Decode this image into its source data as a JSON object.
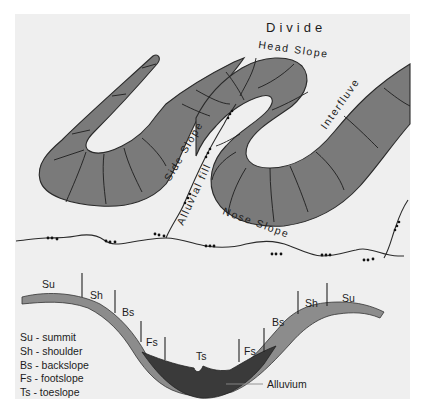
{
  "figure": {
    "type": "hillslope-geomorphology-diagram",
    "plan_view": {
      "labels": {
        "divide": "Divide",
        "head_slope": "Head Slope",
        "interfluve": "Interfluve",
        "side_slope": "Side Slope",
        "alluvial_fill": "Alluvial fill",
        "nose_slope": "Nose Slope"
      }
    },
    "profile_view": {
      "positions_left": [
        "Su",
        "Sh",
        "Bs",
        "Fs"
      ],
      "position_center": "Ts",
      "positions_right": [
        "Fs",
        "Bs",
        "Sh",
        "Su"
      ],
      "alluvium_label": "Alluvium"
    },
    "legend": [
      {
        "abbr": "Su",
        "text": "Su - summit"
      },
      {
        "abbr": "Sh",
        "text": "Sh -  shoulder"
      },
      {
        "abbr": "Bs",
        "text": "Bs - backslope"
      },
      {
        "abbr": "Fs",
        "text": "Fs - footslope"
      },
      {
        "abbr": "Ts",
        "text": "Ts - toeslope"
      }
    ],
    "colors": {
      "background": "#efefef",
      "ridge_fill": "#7a7a7a",
      "soil_fill": "#8c8c8c",
      "alluvium_fill": "#3a3a3a",
      "line": "#1e1e1e"
    }
  }
}
